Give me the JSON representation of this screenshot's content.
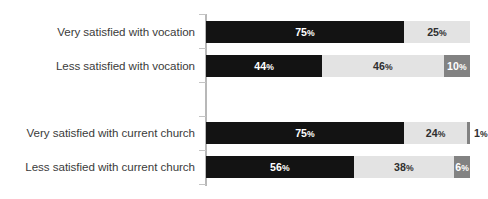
{
  "chart_data": {
    "type": "bar",
    "title": "",
    "subtitle": "",
    "xlabel": "",
    "ylabel": "",
    "orientation": "horizontal",
    "stacked": true,
    "stack_total": 100,
    "xlim": [
      0,
      100
    ],
    "grid": false,
    "legend": false,
    "legend_position": "none",
    "axis_line": true,
    "categories": [
      "Very satisfied with vocation",
      "Less satisfied with vocation",
      "Very satisfied with current church",
      "Less satisfied with current church"
    ],
    "series": [
      {
        "name": "segment-1",
        "color": "#131313",
        "values": [
          75,
          44,
          75,
          56
        ]
      },
      {
        "name": "segment-2",
        "color": "#e3e3e3",
        "values": [
          25,
          46,
          24,
          38
        ]
      },
      {
        "name": "segment-3",
        "color": "#828282",
        "values": [
          0,
          10,
          1,
          6
        ]
      }
    ],
    "group_gap_after_index": 1
  },
  "rows": [
    {
      "label": "Very satisfied with vocation",
      "top": 21,
      "segments": [
        {
          "value": 75,
          "label": "75",
          "suffix": "%",
          "style": "seg-dark",
          "outside": false
        },
        {
          "value": 25,
          "label": "25",
          "suffix": "%",
          "style": "seg-light",
          "outside": false
        }
      ]
    },
    {
      "label": "Less satisfied with vocation",
      "top": 55,
      "segments": [
        {
          "value": 44,
          "label": "44",
          "suffix": "%",
          "style": "seg-dark",
          "outside": false
        },
        {
          "value": 46,
          "label": "46",
          "suffix": "%",
          "style": "seg-light",
          "outside": false
        },
        {
          "value": 10,
          "label": "10",
          "suffix": "%",
          "style": "seg-mid",
          "outside": false
        }
      ]
    },
    {
      "label": "Very satisfied with current church",
      "top": 122,
      "segments": [
        {
          "value": 75,
          "label": "75",
          "suffix": "%",
          "style": "seg-dark",
          "outside": false
        },
        {
          "value": 24,
          "label": "24",
          "suffix": "%",
          "style": "seg-light",
          "outside": false
        },
        {
          "value": 1,
          "label": "1",
          "suffix": "%",
          "style": "seg-mid",
          "outside": true
        }
      ]
    },
    {
      "label": "Less satisfied with current church",
      "top": 156,
      "segments": [
        {
          "value": 56,
          "label": "56",
          "suffix": "%",
          "style": "seg-dark",
          "outside": false
        },
        {
          "value": 38,
          "label": "38",
          "suffix": "%",
          "style": "seg-light",
          "outside": false
        },
        {
          "value": 6,
          "label": "6",
          "suffix": "%",
          "style": "seg-mid",
          "outside": false
        }
      ]
    }
  ],
  "axis": {
    "ticks_top": [
      14,
      48,
      82,
      116,
      150,
      184
    ]
  },
  "colors": {
    "segment_dark": "#131313",
    "segment_light": "#e3e3e3",
    "segment_mid": "#828282",
    "axis": "#b8b8b8",
    "label_text": "#3b3b3b",
    "background": "#ffffff"
  }
}
